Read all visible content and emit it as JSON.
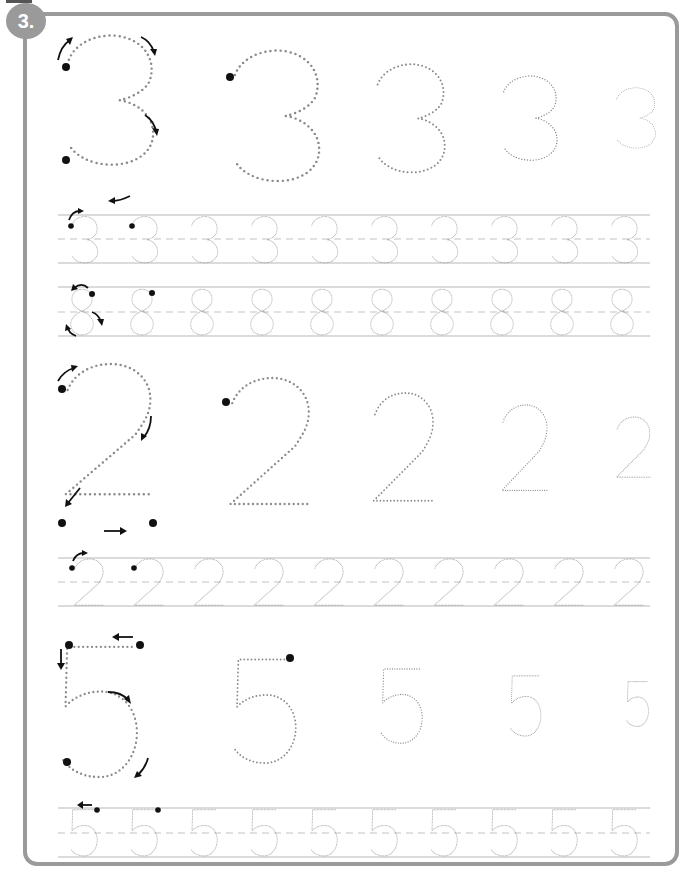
{
  "worksheet": {
    "exercise_number": "3.",
    "colors": {
      "frame": "#9a9a9a",
      "dots": "#8a8a8a",
      "guide_lines": "#b8b8b8",
      "start_dots": "#111111"
    },
    "sections": [
      {
        "digit": "3",
        "model_sizes": [
          "xl",
          "large",
          "medium",
          "small",
          "xs"
        ],
        "practice_rows": [
          {
            "digit": "3",
            "count": 10
          },
          {
            "digit": "8",
            "count": 10
          }
        ]
      },
      {
        "digit": "2",
        "model_sizes": [
          "xl",
          "large",
          "medium",
          "small",
          "xs"
        ],
        "practice_rows": [
          {
            "digit": "2",
            "count": 10
          }
        ]
      },
      {
        "digit": "5",
        "model_sizes": [
          "xl",
          "large",
          "medium",
          "small",
          "xs"
        ],
        "practice_rows": [
          {
            "digit": "5",
            "count": 10
          }
        ]
      }
    ]
  }
}
